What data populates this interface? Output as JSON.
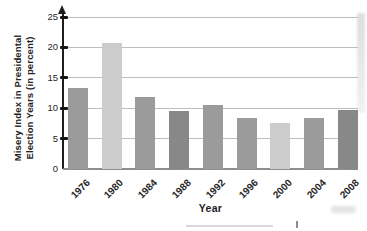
{
  "chart_data": {
    "type": "bar",
    "title": "",
    "xlabel": "Year",
    "ylabel": "Misery Index in Presidental Election Years (in percent)",
    "ylabel_lines": [
      "Misery Index in Presidental",
      "Election Years (in percent)"
    ],
    "categories": [
      "1976",
      "1980",
      "1984",
      "1988",
      "1992",
      "1996",
      "2000",
      "2004",
      "2008"
    ],
    "values": [
      13.4,
      20.8,
      11.8,
      9.5,
      10.5,
      8.4,
      7.5,
      8.4,
      9.7
    ],
    "bar_color_keys": [
      "medium",
      "light",
      "medium",
      "dark",
      "medium",
      "medium",
      "light",
      "medium",
      "dark"
    ],
    "ylim": [
      0,
      25
    ],
    "yticks": [
      0,
      5,
      10,
      15,
      20,
      25
    ],
    "grid": true,
    "legend": null
  },
  "colors": {
    "bar_medium": "#9b9b9b",
    "bar_light": "#cccccc",
    "bar_dark": "#888888",
    "gridline": "#bdbdbd",
    "axis": "#1e1e1e",
    "baseline": "#8f8f8f",
    "text": "#2a2a2a",
    "background": "#ffffff"
  }
}
